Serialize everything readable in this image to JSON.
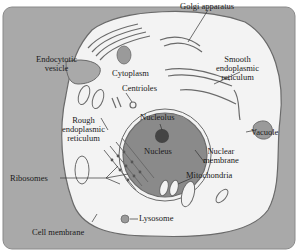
{
  "diagram": {
    "colors": {
      "background_panel": "#a9a9a9",
      "cytoplasm": "#f3f3f3",
      "nucleus": "#8a8a8a",
      "nucleolus": "#444444",
      "organelle_outline": "#6a6a6a",
      "label_text": "#1a1a1a"
    },
    "labels": {
      "golgi": "Golgi apparatus",
      "endocytotic_1": "Endocytotic",
      "endocytotic_2": "vesicle",
      "cytoplasm": "Cytoplasm",
      "smooth_er_1": "Smooth",
      "smooth_er_2": "endoplasmic",
      "smooth_er_3": "reticulum",
      "centrioles": "Centrioles",
      "rough_er_1": "Rough",
      "rough_er_2": "endoplasmic",
      "rough_er_3": "reticulum",
      "nucleolus": "Nucleolus",
      "vacuole": "Vacuole",
      "nucleus": "Nucleus",
      "nuclear_membrane_1": "Nuclear",
      "nuclear_membrane_2": "membrane",
      "ribosomes": "Ribosomes",
      "mitochondria": "Mitochondria",
      "lysosome": "Lysosome",
      "cell_membrane": "Cell membrane"
    }
  }
}
